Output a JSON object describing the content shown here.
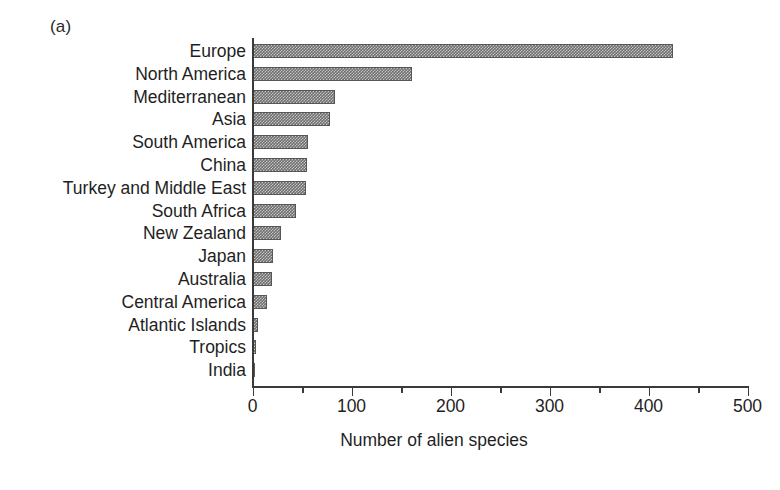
{
  "panel": {
    "label": "(a)"
  },
  "chart_data": {
    "type": "bar",
    "orientation": "horizontal",
    "title": "",
    "xlabel": "Number of alien species",
    "ylabel": "",
    "xlim": [
      0,
      500
    ],
    "xticks": [
      0,
      100,
      200,
      300,
      400,
      500
    ],
    "xtick_labels": [
      "0",
      "100",
      "200",
      "300",
      "400",
      "500"
    ],
    "minor_xticks": [
      50,
      150,
      250,
      350,
      450
    ],
    "grid": false,
    "legend": false,
    "bar_color": "#6e6e6e",
    "bar_pattern": "checker-dither",
    "axis_color": "#3a3a3a",
    "categories": [
      "Europe",
      "North America",
      "Mediterranean",
      "Asia",
      "South America",
      "China",
      "Turkey and Middle East",
      "South Africa",
      "New Zealand",
      "Japan",
      "Australia",
      "Central America",
      "Atlantic Islands",
      "Tropics",
      "India"
    ],
    "values": [
      424,
      161,
      83,
      78,
      56,
      55,
      54,
      43,
      28,
      20,
      19,
      14,
      5,
      3,
      2
    ]
  }
}
